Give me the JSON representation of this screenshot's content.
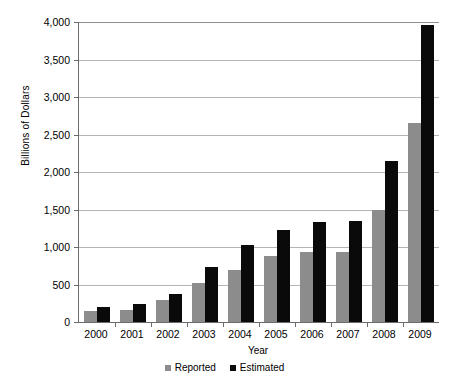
{
  "chart_data": {
    "type": "bar",
    "title": "",
    "xlabel": "Year",
    "ylabel": "Billions of Dollars",
    "categories": [
      "2000",
      "2001",
      "2002",
      "2003",
      "2004",
      "2005",
      "2006",
      "2007",
      "2008",
      "2009"
    ],
    "series": [
      {
        "name": "Reported",
        "color": "#8c8c8c",
        "values": [
          150,
          160,
          295,
          515,
          700,
          875,
          940,
          940,
          1490,
          2650
        ]
      },
      {
        "name": "Estimated",
        "color": "#0a0a0a",
        "values": [
          205,
          245,
          375,
          735,
          1025,
          1225,
          1335,
          1345,
          2150,
          3960
        ]
      }
    ],
    "ylim": [
      0,
      4000
    ],
    "ytick_values": [
      0,
      500,
      1000,
      1500,
      2000,
      2500,
      3000,
      3500,
      4000
    ],
    "ytick_labels": [
      "0",
      "500",
      "1,000",
      "1,500",
      "2,000",
      "2,500",
      "3,000",
      "3,500",
      "4,000"
    ],
    "grid": true,
    "legend_position": "bottom"
  }
}
